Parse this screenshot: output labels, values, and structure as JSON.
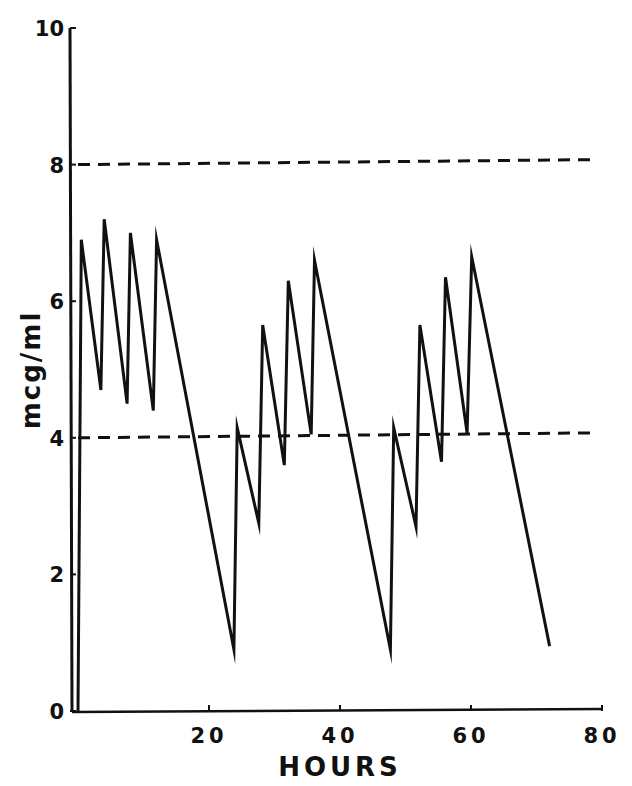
{
  "chart_data": {
    "type": "line",
    "title": "",
    "xlabel": "HOURS",
    "ylabel": "mcg/ml",
    "xlim": [
      0,
      80
    ],
    "ylim": [
      0,
      10
    ],
    "x_ticks": [
      0,
      20,
      40,
      60,
      80
    ],
    "x_tick_labels": [
      "",
      "20",
      "40",
      "60",
      "80"
    ],
    "y_ticks": [
      0,
      2,
      4,
      6,
      8,
      10
    ],
    "y_tick_labels": [
      "0",
      "2",
      "4",
      "6",
      "8",
      "10"
    ],
    "grid": false,
    "legend": null,
    "reference_lines": [
      {
        "name": "upper limit",
        "y": 8,
        "style": "dashed"
      },
      {
        "name": "lower limit",
        "y": 4,
        "style": "dashed"
      }
    ],
    "series": [
      {
        "name": "serum concentration",
        "style": "solid",
        "x": [
          0,
          0.5,
          3.5,
          4,
          7.5,
          8,
          11.5,
          12,
          23.8,
          24.3,
          27.6,
          28.2,
          31.5,
          32.1,
          35.6,
          36.1,
          47.7,
          48.2,
          51.6,
          52.2,
          55.5,
          56.1,
          59.4,
          60.1,
          72
        ],
        "y": [
          0,
          6.9,
          4.7,
          7.2,
          4.5,
          7.0,
          4.4,
          6.9,
          0.9,
          4.15,
          2.75,
          5.65,
          3.6,
          6.3,
          4.05,
          6.6,
          0.9,
          4.15,
          2.7,
          5.65,
          3.65,
          6.35,
          4.07,
          6.65,
          0.95
        ]
      }
    ]
  },
  "colors": {
    "line": "#111111",
    "background": "#ffffff"
  }
}
